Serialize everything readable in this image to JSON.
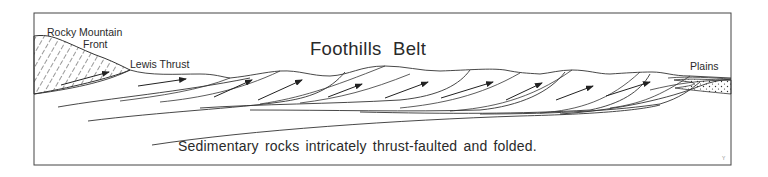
{
  "diagram": {
    "title": "Foothills Belt",
    "labels": {
      "rocky_mountain": "Rocky Mountain",
      "front": "Front",
      "lewis_thrust": "Lewis Thrust",
      "plains": "Plains"
    },
    "caption": "Sedimentary rocks intricately thrust-faulted and folded.",
    "corner_mark": "Y",
    "colors": {
      "line": "#333333",
      "background": "#ffffff",
      "text": "#2a2a2a"
    },
    "regions": [
      {
        "name": "Rocky Mountain Front",
        "fill": "diagonal-hatch"
      },
      {
        "name": "Foothills Belt",
        "fill": "none"
      },
      {
        "name": "Plains",
        "fill": "stipple-dots"
      }
    ],
    "thrust_arrow_count": 10
  }
}
